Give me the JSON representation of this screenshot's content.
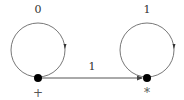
{
  "diagram": {
    "type": "state-graph",
    "colors": {
      "line": "#666666",
      "node": "#000000",
      "text": "#333333"
    },
    "nodes": [
      {
        "id": "left",
        "x": 38,
        "y": 78,
        "label": "+",
        "loop_label": "0"
      },
      {
        "id": "right",
        "x": 147,
        "y": 78,
        "label": "*",
        "loop_label": "1"
      }
    ],
    "edges": [
      {
        "from": "left",
        "to": "right",
        "label": "1"
      }
    ],
    "loops": [
      {
        "node": "left",
        "label": "0"
      },
      {
        "node": "right",
        "label": "1"
      }
    ]
  }
}
